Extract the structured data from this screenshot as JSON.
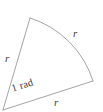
{
  "figure": {
    "kind": "circular-sector",
    "background_color": "#ffffff",
    "stroke_color": "#9a9a9a",
    "text_color": "#3b3b3b",
    "stroke_width": 0.9,
    "canvas": {
      "width": 103,
      "height": 112
    },
    "geometry": {
      "center": {
        "x": 3,
        "y": 110
      },
      "radius": 96,
      "arc_start": {
        "x": 30,
        "y": 18
      },
      "arc_end": {
        "x": 93,
        "y": 81
      },
      "sweep_flag": 1,
      "large_arc_flag": 0,
      "path": "M 3 110 L 30 18 A 96 96 0 0 1 93 81 Z"
    },
    "labels": {
      "radius_left": "r",
      "radius_arc": "r",
      "radius_bottom": "r",
      "central_angle": "1 rad"
    }
  }
}
